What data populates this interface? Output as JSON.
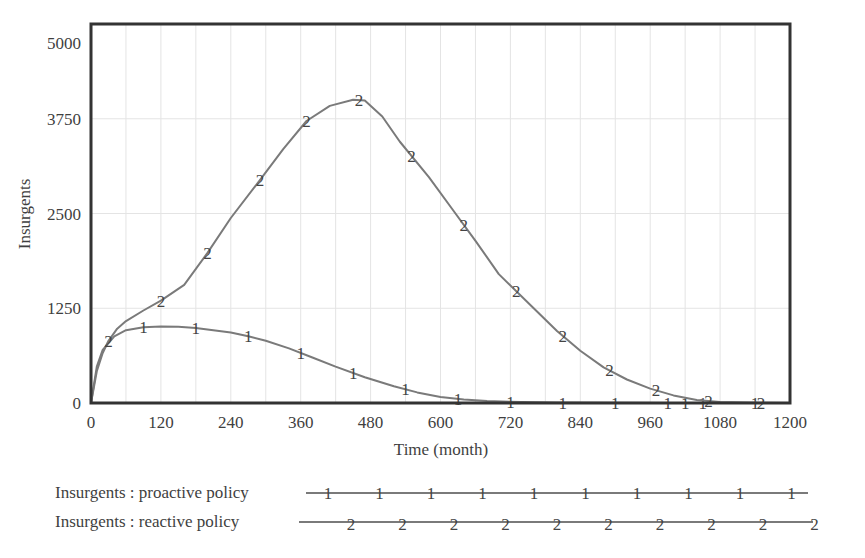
{
  "chart_data": {
    "type": "line",
    "title": "",
    "xlabel": "Time (month)",
    "ylabel": "Insurgents",
    "xlim": [
      0,
      1200
    ],
    "ylim": [
      0,
      5000
    ],
    "x_ticks": [
      0,
      120,
      240,
      360,
      480,
      600,
      720,
      840,
      960,
      1080,
      1200
    ],
    "x_tick_labels": [
      "0",
      "120",
      "240",
      "360",
      "480",
      "600",
      "720",
      "840",
      "960",
      "1080",
      "1200"
    ],
    "y_ticks": [
      0,
      1250,
      2500,
      3750,
      5000
    ],
    "y_tick_labels": [
      "0",
      "1250",
      "2500",
      "3750",
      "5000"
    ],
    "grid": true,
    "legend_position": "bottom",
    "series": [
      {
        "name": "Insurgents : proactive policy",
        "marker_label": "1",
        "color": "#7a7a7a",
        "x": [
          0,
          10,
          20,
          40,
          60,
          90,
          120,
          150,
          180,
          240,
          270,
          300,
          340,
          380,
          420,
          470,
          520,
          560,
          600,
          640,
          680,
          740,
          800,
          900,
          1000,
          1100,
          1200
        ],
        "values": [
          0,
          480,
          700,
          880,
          960,
          1000,
          1010,
          1005,
          990,
          930,
          880,
          820,
          720,
          600,
          480,
          340,
          220,
          140,
          80,
          45,
          25,
          12,
          5,
          2,
          1,
          0,
          0
        ],
        "marker_x": [
          90,
          180,
          270,
          360,
          450,
          540,
          630,
          720,
          810,
          900,
          990,
          1020,
          1050,
          1140
        ]
      },
      {
        "name": "Insurgents : reactive policy",
        "marker_label": "2",
        "color": "#7a7a7a",
        "x": [
          0,
          10,
          20,
          30,
          45,
          60,
          90,
          120,
          160,
          200,
          240,
          290,
          330,
          370,
          410,
          450,
          470,
          500,
          530,
          580,
          620,
          660,
          700,
          760,
          800,
          840,
          880,
          920,
          960,
          1000,
          1040,
          1080,
          1100,
          1150,
          1200
        ],
        "values": [
          0,
          420,
          660,
          820,
          980,
          1080,
          1220,
          1350,
          1560,
          1980,
          2440,
          2940,
          3350,
          3720,
          3920,
          4000,
          3990,
          3780,
          3450,
          2980,
          2560,
          2140,
          1700,
          1250,
          950,
          690,
          470,
          310,
          190,
          100,
          40,
          15,
          10,
          3,
          0
        ],
        "marker_x": [
          30,
          120,
          200,
          290,
          370,
          460,
          550,
          640,
          730,
          810,
          890,
          970,
          1060,
          1150
        ]
      }
    ]
  },
  "legend": {
    "items": [
      {
        "label": "Insurgents : proactive policy",
        "marker": "1"
      },
      {
        "label": "Insurgents : reactive policy",
        "marker": "2"
      }
    ]
  }
}
